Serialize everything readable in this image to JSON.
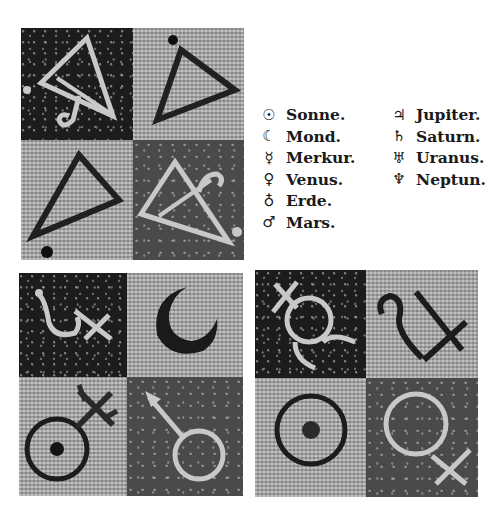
{
  "legend": {
    "left_column": [
      {
        "symbol": "☉",
        "icon": "sun-symbol-icon",
        "label": "Sonne."
      },
      {
        "symbol": "☾",
        "icon": "moon-symbol-icon",
        "label": "Mond."
      },
      {
        "symbol": "☿",
        "icon": "mercury-symbol-icon",
        "label": "Merkur."
      },
      {
        "symbol": "♀",
        "icon": "venus-symbol-icon",
        "label": "Venus."
      },
      {
        "symbol": "♁",
        "icon": "earth-symbol-icon",
        "label": "Erde."
      },
      {
        "symbol": "♂",
        "icon": "mars-symbol-icon",
        "label": "Mars."
      }
    ],
    "right_column": [
      {
        "symbol": "♃",
        "icon": "jupiter-symbol-icon",
        "label": "Jupiter."
      },
      {
        "symbol": "♄",
        "icon": "saturn-symbol-icon",
        "label": "Saturn."
      },
      {
        "symbol": "♅",
        "icon": "uranus-symbol-icon",
        "label": "Uranus."
      },
      {
        "symbol": "♆",
        "icon": "neptune-symbol-icon",
        "label": "Neptun."
      }
    ]
  },
  "panels": {
    "top_left": {
      "description": "Mosaic of four triangle element symbols",
      "tiles": [
        "fire-triangle-with-curl",
        "triangle-dark-outline",
        "triangle-dark-outline",
        "fire-triangle-with-curl"
      ]
    },
    "bottom_left": {
      "description": "Mosaic of planet symbols",
      "tiles": [
        "saturn",
        "moon",
        "earth-sun-cross",
        "mars"
      ]
    },
    "bottom_right": {
      "description": "Mosaic of planet symbols",
      "tiles": [
        "mercury",
        "jupiter",
        "sun",
        "venus"
      ]
    }
  },
  "colors": {
    "dark_tile": "#1c1c1c",
    "light_tile": "#a8a8a8",
    "mid_tile": "#4a4a4a",
    "text": "#1a1a1a"
  }
}
